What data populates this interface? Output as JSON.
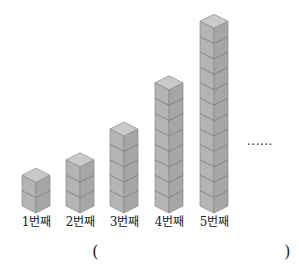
{
  "problem": {
    "stacks": [
      {
        "label": "1번째",
        "cubes": 2
      },
      {
        "label": "2번째",
        "cubes": 3
      },
      {
        "label": "3번째",
        "cubes": 5
      },
      {
        "label": "4번째",
        "cubes": 8
      },
      {
        "label": "5번째",
        "cubes": 12
      }
    ],
    "continuation": "......",
    "answer_open": "(",
    "answer_close": ")",
    "colors": {
      "top_face": "#c9c9c9",
      "left_face": "#b4b4b4",
      "right_face": "#a6a6a6",
      "edge": "#8a8a8a"
    }
  }
}
